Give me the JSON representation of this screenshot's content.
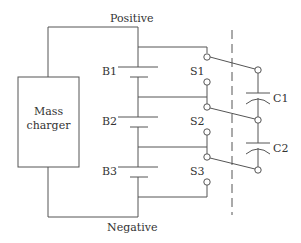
{
  "diagram": {
    "type": "circuit",
    "rails": {
      "top": "Positive",
      "bottom": "Negative"
    },
    "charger": {
      "line1": "Mass",
      "line2": "charger"
    },
    "batteries": [
      {
        "label": "B1"
      },
      {
        "label": "B2"
      },
      {
        "label": "B3"
      }
    ],
    "switches": [
      {
        "label": "S1"
      },
      {
        "label": "S2"
      },
      {
        "label": "S3"
      }
    ],
    "capacitors": [
      {
        "label": "C1"
      },
      {
        "label": "C2"
      }
    ],
    "colors": {
      "stroke": "#555555",
      "text": "#333333",
      "background": "#ffffff"
    }
  }
}
